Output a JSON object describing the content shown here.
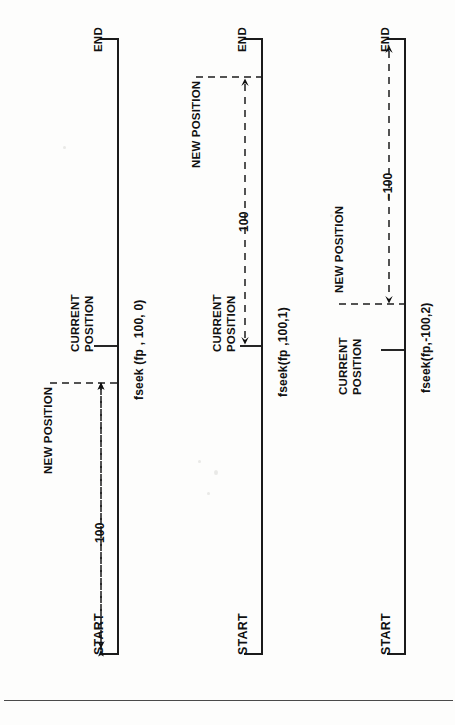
{
  "page": {
    "background": "#fdfdfc",
    "ink": "#111111",
    "orientation": "rotated-90-ccw",
    "bottom_rule": true
  },
  "diagram_data": {
    "type": "diagram",
    "subject": "fseek() file pointer positioning",
    "panels": [
      {
        "id": "panel-1",
        "caption": "fseek (fp , 100, 0)",
        "origin_label": "START",
        "terminus_label": "END",
        "markers": [
          {
            "name": "current-position",
            "label": "CURRENT POSITION",
            "line1": "CURRENT",
            "line2": "POSITION"
          },
          {
            "name": "new-position",
            "label": "NEW POSITION"
          }
        ],
        "offset_label": "100",
        "offset_value": 100,
        "whence": 0,
        "whence_name": "SEEK_SET",
        "measure_from": "START",
        "arrow_direction": "toward-start"
      },
      {
        "id": "panel-2",
        "caption": "fseek(fp ,100,1)",
        "origin_label": "START",
        "terminus_label": "END",
        "markers": [
          {
            "name": "current-position",
            "label": "CURRENT POSITION",
            "line1": "CURRENT",
            "line2": "POSITION"
          },
          {
            "name": "new-position",
            "label": "NEW POSITION"
          }
        ],
        "offset_label": "100",
        "offset_value": 100,
        "whence": 1,
        "whence_name": "SEEK_CUR",
        "measure_from": "CURRENT POSITION",
        "arrow_direction": "both"
      },
      {
        "id": "panel-3",
        "caption": "fseek(fp,-100,2)",
        "origin_label": "START",
        "terminus_label": "END",
        "markers": [
          {
            "name": "current-position",
            "label": "CURRENT POSITION",
            "line1": "CURRENT",
            "line2": "POSITION"
          },
          {
            "name": "new-position",
            "label": "NEW POSITION"
          }
        ],
        "offset_label": "–100",
        "offset_value": -100,
        "whence": 2,
        "whence_name": "SEEK_END",
        "measure_from": "END",
        "arrow_direction": "both"
      }
    ]
  },
  "panel1": {
    "end": "END",
    "start": "START",
    "current_line1": "CURRENT",
    "current_line2": "POSITION",
    "new_position": "NEW POSITION",
    "amount": "100",
    "caption": "fseek (fp , 100, 0)"
  },
  "panel2": {
    "end": "END",
    "start": "START",
    "current_line1": "CURRENT",
    "current_line2": "POSITION",
    "new_position": "NEW POSITION",
    "amount": "100",
    "caption": "fseek(fp ,100,1)"
  },
  "panel3": {
    "end": "END",
    "start": "START",
    "current_line1": "CURRENT",
    "current_line2": "POSITION",
    "new_position": "NEW POSITION",
    "amount": "–100",
    "caption": "fseek(fp,-100,2)"
  }
}
